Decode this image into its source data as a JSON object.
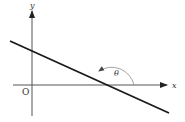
{
  "diagram": {
    "labels": {
      "y_axis": "y",
      "x_axis": "x",
      "origin": "O",
      "angle": "θ"
    },
    "colors": {
      "axis": "#555555",
      "line": "#1a1a1a",
      "arc": "#9a9a9a",
      "text": "#333333",
      "background": "#ffffff"
    },
    "elements": [
      {
        "id": "x-axis",
        "type": "arrow",
        "from": [
          13,
          85
        ],
        "to": [
          168,
          85
        ]
      },
      {
        "id": "y-axis",
        "type": "arrow",
        "from": [
          32,
          116
        ],
        "to": [
          32,
          10
        ]
      },
      {
        "id": "line",
        "type": "segment",
        "from": [
          10,
          41
        ],
        "to": [
          169,
          113
        ]
      },
      {
        "id": "angle-arc",
        "type": "arc",
        "center": [
          111,
          85
        ],
        "radius": 23,
        "start_deg": 0,
        "end_deg": 155
      }
    ]
  }
}
